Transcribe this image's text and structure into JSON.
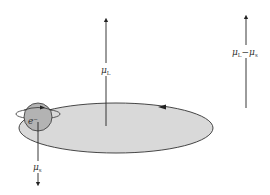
{
  "diagram": {
    "orbit": {
      "fill": "#d9d9d9",
      "stroke": "#333333"
    },
    "electron": {
      "label": "e",
      "charge": "−",
      "fill": "#b3b3b3"
    },
    "arrows": {
      "orbital_moment": {
        "symbol": "μ",
        "subscript": "L"
      },
      "spin_moment": {
        "symbol": "μ",
        "subscript": "s"
      },
      "net_moment": {
        "symbol_a": "μ",
        "subscript_a": "L",
        "operator": "−",
        "symbol_b": "μ",
        "subscript_b": "s"
      }
    }
  }
}
